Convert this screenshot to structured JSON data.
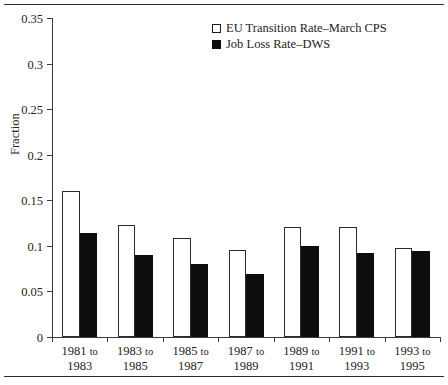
{
  "chart_data": {
    "type": "bar",
    "title": "",
    "subtitle": "",
    "xlabel": "",
    "ylabel": "Fraction",
    "ylim": [
      0,
      0.35
    ],
    "yticks": [
      "0",
      "0.05",
      "0.1",
      "0.15",
      "0.2",
      "0.25",
      "0.3",
      "0.35"
    ],
    "ytick_values": [
      0,
      0.05,
      0.1,
      0.15,
      0.2,
      0.25,
      0.3,
      0.35
    ],
    "grid": false,
    "legend_position": "top-center",
    "categories": [
      "1981 to 1983",
      "1983 to 1985",
      "1985 to 1987",
      "1987 to 1989",
      "1989 to 1991",
      "1991 to 1993",
      "1993 to 1995"
    ],
    "category_lines": [
      {
        "first": "1981",
        "connector": "to",
        "second": "1983"
      },
      {
        "first": "1983",
        "connector": "to",
        "second": "1985"
      },
      {
        "first": "1985",
        "connector": "to",
        "second": "1987"
      },
      {
        "first": "1987",
        "connector": "to",
        "second": "1989"
      },
      {
        "first": "1989",
        "connector": "to",
        "second": "1991"
      },
      {
        "first": "1991",
        "connector": "to",
        "second": "1993"
      },
      {
        "first": "1993",
        "connector": "to",
        "second": "1995"
      }
    ],
    "series": [
      {
        "name": "EU Transition Rate–March CPS",
        "style": "open",
        "color": "#ffffff",
        "edge_color": "#2a2a2a",
        "values": [
          0.16,
          0.123,
          0.109,
          0.096,
          0.121,
          0.121,
          0.098
        ]
      },
      {
        "name": "Job Loss Rate–DWS",
        "style": "solid",
        "color": "#0d0d0d",
        "edge_color": "#0d0d0d",
        "values": [
          0.114,
          0.09,
          0.08,
          0.069,
          0.1,
          0.092,
          0.094
        ]
      }
    ]
  },
  "legend": {
    "items": [
      {
        "label": "EU Transition Rate–March CPS",
        "style": "open"
      },
      {
        "label": "Job Loss Rate–DWS",
        "style": "solid"
      }
    ]
  },
  "axis": {
    "y_title": "Fraction"
  }
}
